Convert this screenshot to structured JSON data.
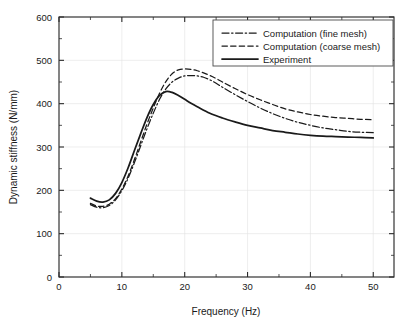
{
  "chart_data": {
    "type": "line",
    "title": "",
    "xlabel": "Frequency (Hz)",
    "ylabel": "Dynamic stiffness (N/mm)",
    "xlim": [
      0,
      53.3
    ],
    "ylim": [
      0,
      600
    ],
    "x_ticks": [
      0,
      10,
      20,
      30,
      40,
      50
    ],
    "x_tick_labels": [
      "0",
      "10",
      "20",
      "30",
      "40",
      "50"
    ],
    "x_minor_step": 5,
    "y_ticks": [
      0,
      100,
      200,
      300,
      400,
      500,
      600
    ],
    "y_tick_labels": [
      "0",
      "100",
      "200",
      "300",
      "400",
      "500",
      "600"
    ],
    "y_minor_step": 50,
    "grid": true,
    "grid_color": "#e2e2e2",
    "legend_position": "top-right",
    "line_color": "#1a1a1a",
    "series": [
      {
        "name": "Computation (fine mesh)",
        "style": "dash-dot",
        "dasharray": "7,2.6,1.4,2.6",
        "width": 1.25,
        "x": [
          5,
          6,
          7,
          8,
          9,
          10,
          11,
          12,
          13,
          14,
          15,
          16,
          17,
          18,
          19,
          20,
          21,
          22,
          23,
          24,
          25,
          26,
          28,
          30,
          32,
          34,
          36,
          38,
          40,
          42,
          44,
          46,
          48,
          50
        ],
        "y": [
          167,
          161,
          160,
          165,
          178,
          199,
          228,
          264,
          303,
          342,
          378,
          410,
          434,
          450,
          459,
          464,
          465,
          464,
          461,
          455,
          447,
          438,
          421,
          405,
          390,
          377,
          366,
          357,
          350,
          344,
          340,
          336,
          334,
          333
        ]
      },
      {
        "name": "Computation (coarse mesh)",
        "style": "dashed",
        "dasharray": "5.4,3.2",
        "width": 1.25,
        "x": [
          5,
          6,
          7,
          8,
          9,
          10,
          11,
          12,
          13,
          14,
          15,
          16,
          17,
          18,
          19,
          20,
          21,
          22,
          23,
          24,
          25,
          26,
          28,
          30,
          32,
          34,
          36,
          38,
          40,
          42,
          44,
          46,
          48,
          50
        ],
        "y": [
          170,
          164,
          163,
          168,
          181,
          203,
          233,
          271,
          312,
          353,
          390,
          424,
          451,
          469,
          478,
          480,
          479,
          476,
          471,
          465,
          458,
          450,
          435,
          421,
          409,
          398,
          388,
          381,
          375,
          371,
          368,
          366,
          364,
          363
        ]
      },
      {
        "name": "Experiment",
        "style": "solid",
        "dasharray": "",
        "width": 1.75,
        "x": [
          5,
          6,
          7,
          8,
          9,
          10,
          11,
          12,
          13,
          14,
          15,
          16,
          17,
          18,
          19,
          20,
          21,
          22,
          24,
          26,
          28,
          30,
          32,
          34,
          36,
          38,
          40,
          42,
          44,
          46,
          48,
          50
        ],
        "y": [
          182,
          175,
          173,
          178,
          193,
          218,
          252,
          292,
          331,
          368,
          398,
          419,
          428,
          426,
          419,
          410,
          401,
          393,
          378,
          367,
          358,
          350,
          344,
          338,
          334,
          330,
          327,
          325,
          324,
          323,
          322,
          321
        ]
      }
    ]
  },
  "legend": {
    "entries": [
      {
        "label": "Computation (fine mesh)"
      },
      {
        "label": "Computation (coarse mesh)"
      },
      {
        "label": "Experiment"
      }
    ]
  },
  "axes": {
    "x_title": "Frequency (Hz)",
    "y_title": "Dynamic stiffness (N/mm)"
  }
}
